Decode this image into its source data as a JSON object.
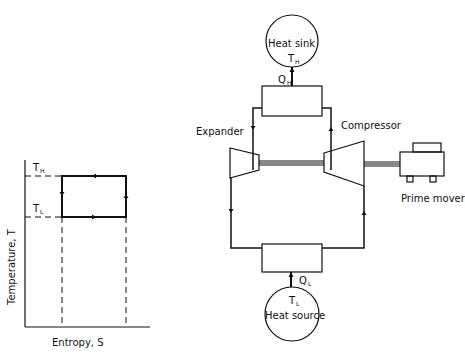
{
  "ts_diagram": {
    "ylabel": "Temperature, T",
    "xlabel": "Entropy, S",
    "th_label": "T",
    "th_sub": "H",
    "tl_label": "T",
    "tl_sub": "L"
  },
  "schematic": {
    "heat_sink": {
      "label": "Heat sink",
      "temp": "T",
      "temp_sub": "H"
    },
    "heat_source": {
      "label": "Heat source",
      "temp": "T",
      "temp_sub": "L"
    },
    "qh": {
      "label": "Q",
      "sub": "H"
    },
    "ql": {
      "label": "Q",
      "sub": "L"
    },
    "expander_label": "Expander",
    "compressor_label": "Compressor",
    "prime_mover_label": "Prime mover"
  },
  "colors": {
    "line": "#111111",
    "background": "#ffffff"
  }
}
